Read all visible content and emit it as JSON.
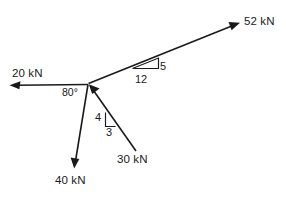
{
  "diagram": {
    "type": "free-body-force-diagram",
    "background_color": "#ffffff",
    "line_color": "#1a1a1a",
    "origin": {
      "x": 88,
      "y": 84
    },
    "units": "kN",
    "forces": [
      {
        "id": "force-20kn",
        "label": "20 kN",
        "magnitude": 20,
        "direction": "left",
        "arrow_points": "away-from-origin",
        "tip": {
          "x": 10,
          "y": 85
        },
        "tail": {
          "x": 88,
          "y": 84
        }
      },
      {
        "id": "force-52kn",
        "label": "52 kN",
        "magnitude": 52,
        "direction": "up-right",
        "arrow_points": "away-from-origin",
        "tip": {
          "x": 240,
          "y": 23
        },
        "tail": {
          "x": 88,
          "y": 84
        },
        "slope": {
          "rise": "5",
          "run": "12"
        }
      },
      {
        "id": "force-30kn",
        "label": "30 kN",
        "magnitude": 30,
        "direction": "down-right",
        "arrow_points": "toward-origin",
        "tip": {
          "x": 88,
          "y": 84
        },
        "tail": {
          "x": 136,
          "y": 151
        },
        "slope": {
          "rise": "4",
          "run": "3"
        }
      },
      {
        "id": "force-40kn",
        "label": "40 kN",
        "magnitude": 40,
        "direction": "down-left",
        "arrow_points": "away-from-origin",
        "tip": {
          "x": 74,
          "y": 168
        },
        "tail": {
          "x": 88,
          "y": 84
        }
      }
    ],
    "angles": [
      {
        "id": "angle-80",
        "label": "80°",
        "value": 80,
        "between": [
          "force-20kn",
          "force-40kn"
        ]
      }
    ],
    "slope_triangles": [
      {
        "id": "slope-triangle-5-12",
        "on": "force-52kn",
        "vertical_label": "5",
        "horizontal_label": "12"
      },
      {
        "id": "slope-triangle-4-3",
        "on": "force-30kn",
        "vertical_label": "4",
        "horizontal_label": "3"
      }
    ]
  }
}
